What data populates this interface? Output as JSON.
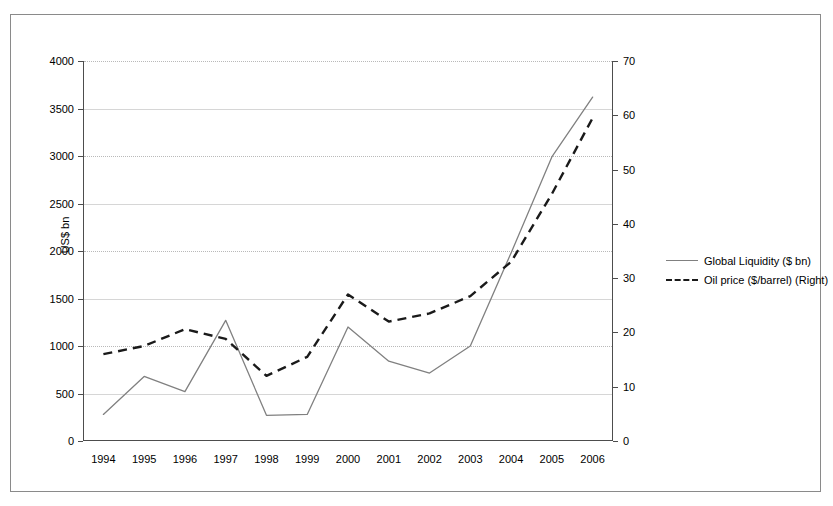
{
  "chart_data": {
    "type": "line",
    "title": "",
    "xlabel": "",
    "ylabel": "US$ bn",
    "ylabel_right": "",
    "categories": [
      "1994",
      "1995",
      "1996",
      "1997",
      "1998",
      "1999",
      "2000",
      "2001",
      "2002",
      "2003",
      "2004",
      "2005",
      "2006"
    ],
    "ylim": [
      0,
      4000
    ],
    "yticks": [
      0,
      500,
      1000,
      1500,
      2000,
      2500,
      3000,
      3500,
      4000
    ],
    "ylim_right": [
      0,
      70
    ],
    "yticks_right": [
      0,
      10,
      20,
      30,
      40,
      50,
      60,
      70
    ],
    "grid": true,
    "legend_position": "right",
    "series": [
      {
        "name": "Global Liquidity ($ bn)",
        "axis": "left",
        "style": "solid",
        "color": "#808080",
        "values": [
          280,
          680,
          520,
          1270,
          270,
          280,
          1200,
          840,
          715,
          1000,
          1980,
          2990,
          3620
        ]
      },
      {
        "name": "Oil price ($/barrel) (Right)",
        "axis": "right",
        "style": "dashed",
        "color": "#1a1a1a",
        "values": [
          16,
          17.5,
          20.6,
          18.8,
          12,
          15.5,
          27,
          22,
          23.5,
          26.7,
          33,
          45.5,
          59.5
        ]
      }
    ]
  },
  "legend": {
    "items": [
      {
        "label": "Global Liquidity ($ bn)",
        "style": "solid"
      },
      {
        "label": "Oil price ($/barrel) (Right)",
        "style": "dashed"
      }
    ]
  }
}
